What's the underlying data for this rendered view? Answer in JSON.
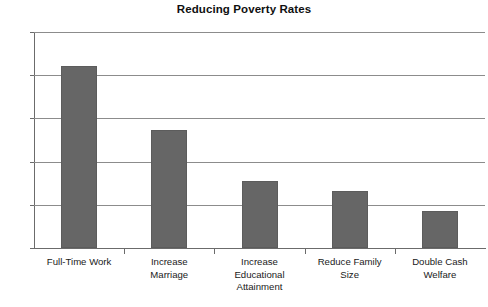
{
  "chart_data": {
    "type": "bar",
    "title": "Reducing Poverty Rates",
    "xlabel": "",
    "ylabel": "",
    "ylim": [
      0,
      50
    ],
    "yticks": [
      0,
      10,
      20,
      30,
      40,
      50
    ],
    "grid": true,
    "legend": "none",
    "bar_color": "#666666",
    "categories": [
      "Full-Time Work",
      "Increase Marriage",
      "Increase Educational Attainment",
      "Reduce Family Size",
      "Double Cash Welfare"
    ],
    "category_lines": [
      [
        "Full-Time Work"
      ],
      [
        "Increase",
        "Marriage"
      ],
      [
        "Increase",
        "Educational",
        "Attainment"
      ],
      [
        "Reduce Family",
        "Size"
      ],
      [
        "Double Cash",
        "Welfare"
      ]
    ],
    "values": [
      42.1,
      27.3,
      15.5,
      13.2,
      8.6
    ]
  }
}
